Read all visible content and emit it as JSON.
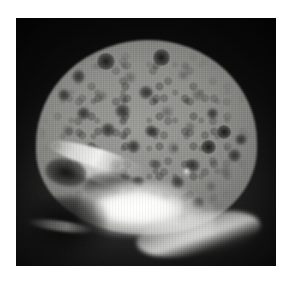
{
  "figure": {
    "modality": "radiograph",
    "view": "lateral",
    "anatomy": "skull",
    "caption": "",
    "background_color": "#ffffff",
    "plate_color": "#050505"
  },
  "plate": {
    "left": 16,
    "top": 18,
    "width": 260,
    "height": 248
  },
  "palette": {
    "film_background": "#050505",
    "cortical_bright": "#fefefc",
    "diploe_gray": "#8e8e8b",
    "lesion_dark": "#1c1c1b",
    "skull_base_white": "#ffffff",
    "page_white": "#ffffff"
  },
  "regions": [
    {
      "name": "calvarial-cortical-rim",
      "description": "bright outer table of skull vault"
    },
    {
      "name": "cranial-interior",
      "description": "mottled gray diploic space"
    },
    {
      "name": "skull-base",
      "description": "dense bright petrous and basal bone"
    },
    {
      "name": "orbital-roof",
      "description": "bright linear anterior fossa band"
    },
    {
      "name": "frontal-sinus",
      "description": "lucent air-filled frontal sinus"
    },
    {
      "name": "facial-shadow",
      "description": "dark facial soft tissue region"
    }
  ],
  "lesions": [
    {
      "cx": 34.5,
      "cy": 17.5,
      "r": 3.4,
      "tone": "deep"
    },
    {
      "cx": 56.0,
      "cy": 16.0,
      "r": 3.2,
      "tone": "deep"
    },
    {
      "cx": 24.0,
      "cy": 23.5,
      "r": 2.6,
      "tone": "normal"
    },
    {
      "cx": 44.0,
      "cy": 24.0,
      "r": 2.3,
      "tone": "faint"
    },
    {
      "cx": 64.5,
      "cy": 23.0,
      "r": 2.1,
      "tone": "faint"
    },
    {
      "cx": 18.5,
      "cy": 31.0,
      "r": 2.4,
      "tone": "normal"
    },
    {
      "cx": 33.0,
      "cy": 31.5,
      "r": 2.0,
      "tone": "faint"
    },
    {
      "cx": 50.0,
      "cy": 30.0,
      "r": 2.6,
      "tone": "normal"
    },
    {
      "cx": 70.0,
      "cy": 31.0,
      "r": 2.2,
      "tone": "faint"
    },
    {
      "cx": 26.0,
      "cy": 38.5,
      "r": 2.5,
      "tone": "normal"
    },
    {
      "cx": 41.0,
      "cy": 37.5,
      "r": 2.8,
      "tone": "normal"
    },
    {
      "cx": 58.0,
      "cy": 38.0,
      "r": 2.3,
      "tone": "faint"
    },
    {
      "cx": 75.5,
      "cy": 38.5,
      "r": 2.1,
      "tone": "normal"
    },
    {
      "cx": 20.0,
      "cy": 45.5,
      "r": 2.2,
      "tone": "faint"
    },
    {
      "cx": 35.5,
      "cy": 45.0,
      "r": 2.7,
      "tone": "normal"
    },
    {
      "cx": 52.0,
      "cy": 45.5,
      "r": 2.4,
      "tone": "normal"
    },
    {
      "cx": 67.0,
      "cy": 44.0,
      "r": 2.0,
      "tone": "faint"
    },
    {
      "cx": 80.0,
      "cy": 46.0,
      "r": 2.6,
      "tone": "deep"
    },
    {
      "cx": 86.5,
      "cy": 49.0,
      "r": 2.3,
      "tone": "normal"
    },
    {
      "cx": 29.0,
      "cy": 52.5,
      "r": 2.3,
      "tone": "faint"
    },
    {
      "cx": 45.0,
      "cy": 52.0,
      "r": 2.5,
      "tone": "normal"
    },
    {
      "cx": 60.5,
      "cy": 52.5,
      "r": 2.2,
      "tone": "faint"
    },
    {
      "cx": 74.0,
      "cy": 52.0,
      "r": 2.8,
      "tone": "deep"
    },
    {
      "cx": 84.0,
      "cy": 55.5,
      "r": 2.4,
      "tone": "normal"
    },
    {
      "cx": 38.0,
      "cy": 59.5,
      "r": 2.4,
      "tone": "normal"
    },
    {
      "cx": 54.0,
      "cy": 59.0,
      "r": 2.1,
      "tone": "faint"
    },
    {
      "cx": 68.0,
      "cy": 59.5,
      "r": 2.6,
      "tone": "normal"
    },
    {
      "cx": 80.5,
      "cy": 62.0,
      "r": 2.2,
      "tone": "faint"
    },
    {
      "cx": 47.0,
      "cy": 66.0,
      "r": 2.3,
      "tone": "normal"
    },
    {
      "cx": 62.0,
      "cy": 66.5,
      "r": 2.5,
      "tone": "normal"
    },
    {
      "cx": 75.0,
      "cy": 68.0,
      "r": 2.0,
      "tone": "faint"
    },
    {
      "cx": 57.0,
      "cy": 73.0,
      "r": 2.2,
      "tone": "normal"
    },
    {
      "cx": 70.0,
      "cy": 74.5,
      "r": 2.4,
      "tone": "normal"
    },
    {
      "cx": 30.0,
      "cy": 65.0,
      "r": 2.1,
      "tone": "faint"
    },
    {
      "cx": 64.0,
      "cy": 81.0,
      "r": 2.3,
      "tone": "normal"
    },
    {
      "cx": 52.5,
      "cy": 80.0,
      "r": 1.9,
      "tone": "faint"
    }
  ],
  "sclerotic_foci": [
    {
      "cx": 65.5,
      "cy": 62.0,
      "r": 1.4
    },
    {
      "cx": 41.0,
      "cy": 69.5,
      "r": 1.2
    }
  ]
}
